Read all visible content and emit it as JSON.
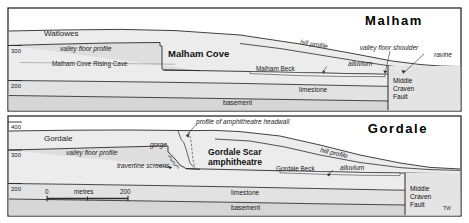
{
  "figure": {
    "signature": "TW",
    "panels": [
      {
        "id": "malham",
        "title": "Malham",
        "axis_ticks": [
          "300",
          "200"
        ],
        "labels": {
          "dry_valley": "Watlowes",
          "valley_floor_profile": "valley floor profile",
          "landform": "Malham Cove",
          "cave": "Malham Cove Rising Cave",
          "hill_profile": "hill profile",
          "beck": "Malham Beck",
          "alluvium": "alluvium",
          "valley_floor_shoulder": "valley floor shoulder",
          "ravine": "ravine",
          "limestone": "limestone",
          "basement": "basement",
          "fault": "Middle Craven Fault"
        }
      },
      {
        "id": "gordale",
        "title": "Gordale",
        "axis_ticks": [
          "400",
          "300",
          "200"
        ],
        "labels": {
          "dry_valley": "Gordale",
          "valley_floor_profile": "valley floor profile",
          "gorge": "gorge",
          "travertine": "travertine screens",
          "headwall": "profile of amphitheatre headwall",
          "landform_line1": "Gordale Scar",
          "landform_line2": "amphitheatre",
          "hill_profile": "hill profile",
          "beck": "Gordale Beck",
          "alluvium": "alluvium",
          "limestone": "limestone",
          "basement": "basement",
          "fault": "Middle Craven Fault"
        },
        "scalebar": {
          "start": "0",
          "unit": "metres",
          "end": "200"
        }
      }
    ],
    "colors": {
      "frame": "#1a1a1a",
      "line": "#2b2b2b",
      "sky": "#ffffff",
      "valley_fill": "#e6e6e6",
      "limestone_fill": "#e2e2e2",
      "basement_fill": "#dadada",
      "fault_block": "#e2e2e2",
      "text": "#111111"
    }
  }
}
